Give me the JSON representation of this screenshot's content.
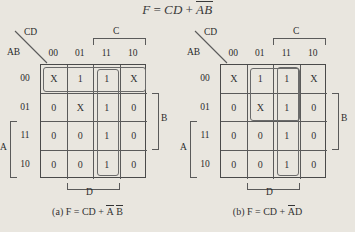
{
  "figure": {
    "title_formula": {
      "lhs": "F",
      "eq": "=",
      "term1": "CD",
      "plus": "+",
      "term2_a": "A",
      "term2_b": "B",
      "full_text": "F = CD + A̅B̅"
    },
    "row_label": "AB",
    "col_label": "CD",
    "row_headers": [
      "00",
      "01",
      "11",
      "10"
    ],
    "col_headers": [
      "00",
      "01",
      "11",
      "10"
    ],
    "brackets": {
      "c": "C",
      "d": "D",
      "b": "B",
      "a": "A"
    }
  },
  "maps": [
    {
      "id": "kmap-a",
      "cells": [
        [
          "X",
          "1",
          "1",
          "X"
        ],
        [
          "0",
          "X",
          "1",
          "0"
        ],
        [
          "0",
          "0",
          "1",
          "0"
        ],
        [
          "0",
          "0",
          "1",
          "0"
        ]
      ],
      "groups": [
        {
          "name": "group-top-row",
          "left": 1.5,
          "top": 1.5,
          "width": 103,
          "height": 25.5
        },
        {
          "name": "group-col-11",
          "left": 55.5,
          "top": 3.5,
          "width": 22.5,
          "height": 107
        }
      ],
      "caption": {
        "prefix": "(a) F  =  CD  +  ",
        "label": "(a)",
        "lhs": "F",
        "eq": "=",
        "term1": "CD",
        "plus": "+",
        "term2_a": "A",
        "term2_b": "B",
        "full_text": "(a) F = CD + A̅ B̅"
      }
    },
    {
      "id": "kmap-b",
      "cells": [
        [
          "X",
          "1",
          "1",
          "X"
        ],
        [
          "0",
          "X",
          "1",
          "0"
        ],
        [
          "0",
          "0",
          "1",
          "0"
        ],
        [
          "0",
          "0",
          "1",
          "0"
        ]
      ],
      "groups": [
        {
          "name": "group-2x2-ad",
          "left": 28.5,
          "top": 2.5,
          "width": 50,
          "height": 53
        },
        {
          "name": "group-col-11",
          "left": 55.5,
          "top": 1.5,
          "width": 22.5,
          "height": 109
        }
      ],
      "caption": {
        "prefix": "(b) F  =  CD  +  ",
        "label": "(b)",
        "lhs": "F",
        "eq": "=",
        "term1": "CD",
        "plus": "+",
        "term2_a": "A",
        "term2_b": "D",
        "full_text": "(b) F = CD + A̅D"
      }
    }
  ],
  "colors": {
    "background": "#e9e6df",
    "ink": "#333333",
    "grid_line": "#5a5a5a",
    "group_line": "#6a6a6a"
  }
}
